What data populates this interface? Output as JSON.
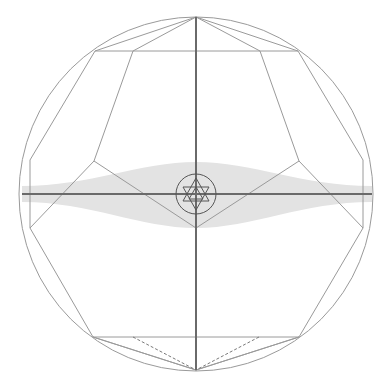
{
  "diagram": {
    "type": "geometric-construction",
    "outer_circle": {
      "cx": 196,
      "cy": 194,
      "r": 177
    },
    "center_circle": {
      "cx": 196,
      "cy": 194,
      "r": 20
    },
    "colors": {
      "line": "#9a9a9a",
      "axis": "#6a6a6a",
      "lens_fill": "#e2e2e2",
      "background": "#ffffff"
    },
    "top_point": [
      196,
      17
    ],
    "bottom_point": [
      196,
      370
    ],
    "horizontal_axis": {
      "y": 194,
      "x1": 22,
      "x2": 372
    },
    "vertical_axis": {
      "x": 196,
      "y1": 17,
      "y2": 370
    }
  }
}
